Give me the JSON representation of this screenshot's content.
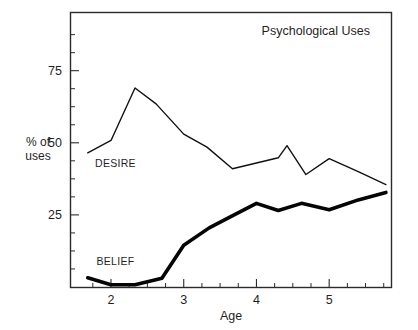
{
  "chart_data": {
    "type": "line",
    "title": "Psychological Uses",
    "xlabel": "Age",
    "ylabel": "% of\nuses",
    "ylabel_line1": "% of",
    "ylabel_line2": "uses",
    "xlim": [
      1.45,
      5.85
    ],
    "ylim": [
      0,
      95
    ],
    "grid": false,
    "legend_position": "inline-labels",
    "x_ticks_major": [
      2,
      3,
      4,
      5
    ],
    "x_tick_labels": [
      "2",
      "3",
      "4",
      "5"
    ],
    "x_ticks_minor": [
      1.75,
      2.25,
      2.5,
      2.75,
      3.25,
      3.5,
      3.75,
      4.25,
      4.5,
      4.75,
      5.25,
      5.5,
      5.75
    ],
    "y_ticks_major": [
      25,
      50,
      75
    ],
    "y_tick_labels": [
      "25",
      "50",
      "75"
    ],
    "y_ticks_minor": [
      6.25,
      12.5,
      18.75,
      31.25,
      37.5,
      43.75,
      56.25,
      62.5,
      68.75,
      81.25,
      87.5
    ],
    "series": [
      {
        "name": "DESIRE",
        "style": "thin",
        "color": "#111111",
        "label_x": 1.78,
        "label_y": 41.5,
        "x": [
          1.68,
          2.0,
          2.33,
          2.62,
          3.0,
          3.32,
          3.67,
          4.0,
          4.3,
          4.42,
          4.68,
          5.0,
          5.4,
          5.78
        ],
        "y": [
          46.5,
          50.8,
          69.0,
          63.5,
          53.0,
          48.5,
          41.0,
          43.0,
          44.8,
          49.0,
          39.0,
          44.5,
          40.0,
          35.5
        ]
      },
      {
        "name": "BELIEF",
        "style": "thick",
        "color": "#050505",
        "label_x": 1.8,
        "label_y": 7.6,
        "x": [
          1.68,
          2.0,
          2.33,
          2.7,
          3.0,
          3.35,
          3.68,
          4.0,
          4.3,
          4.62,
          5.0,
          5.4,
          5.78
        ],
        "y": [
          3.2,
          0.8,
          0.8,
          3.0,
          14.5,
          20.5,
          24.8,
          29.0,
          26.5,
          29.0,
          26.8,
          30.2,
          32.8
        ]
      }
    ]
  },
  "colors": {
    "frame": "#2b2b2b",
    "background": "#ffffff",
    "ink": "#1a1a1a"
  }
}
